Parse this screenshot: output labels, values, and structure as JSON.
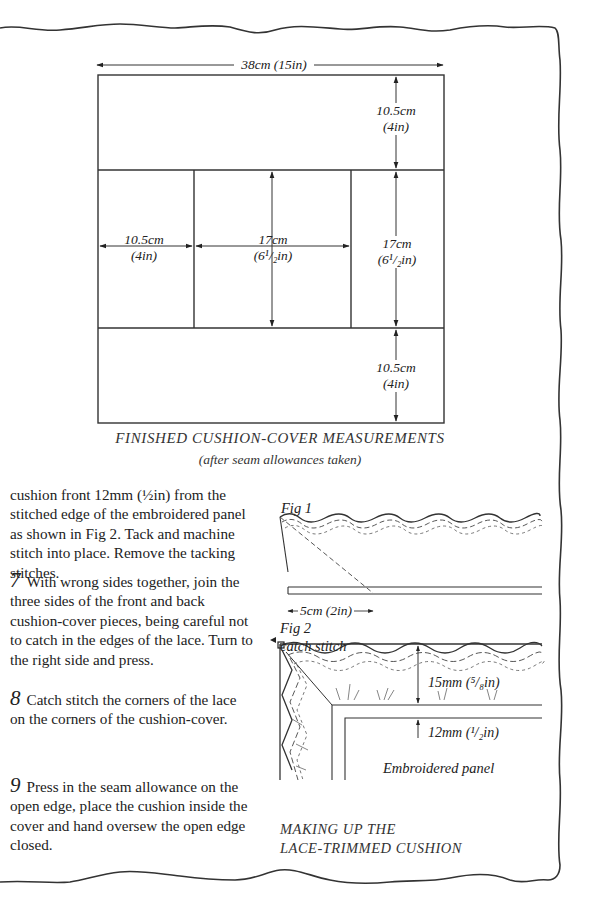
{
  "diagram_top": {
    "width_label": "38cm (15in)",
    "top_band_label_cm": "10.5cm",
    "top_band_label_in": "(4in)",
    "left_panel_label_cm": "10.5cm",
    "left_panel_label_in": "(4in)",
    "center_panel_label_cm": "17cm",
    "center_panel_label_in": "(6¹/₂in)",
    "right_panel_label_cm": "17cm",
    "right_panel_label_in": "(6¹/₂in)",
    "bottom_band_label_cm": "10.5cm",
    "bottom_band_label_in": "(4in)",
    "caption": "FINISHED CUSHION-COVER MEASUREMENTS",
    "subcaption": "(after seam allowances taken)"
  },
  "instructions": {
    "continuation": "cushion front 12mm (½in) from the stitched edge of the embroidered panel as shown in Fig 2. Tack and machine stitch into place. Remove the tacking stitches.",
    "steps": [
      {
        "number": "7",
        "text": "With wrong sides together, join the three sides of the front and back cushion-cover pieces, being careful not to catch in the edges of the lace. Turn to the right side and press."
      },
      {
        "number": "8",
        "text": "Catch stitch the corners of the lace on the corners of the cushion-cover."
      },
      {
        "number": "9",
        "text": "Press in the seam allowance on the open edge, place the cushion inside the cover and hand oversew the open edge closed."
      }
    ]
  },
  "figures": {
    "fig1": {
      "label": "Fig 1",
      "measure": "5cm (2in)"
    },
    "fig2": {
      "label": "Fig 2",
      "catch_stitch": "catch stitch",
      "measure_lace": "15mm (⁵/₈in)",
      "measure_offset": "12mm (¹/₂in)",
      "panel_label": "Embroidered panel"
    },
    "caption_line1": "MAKING UP THE",
    "caption_line2": "LACE-TRIMMED CUSHION"
  }
}
